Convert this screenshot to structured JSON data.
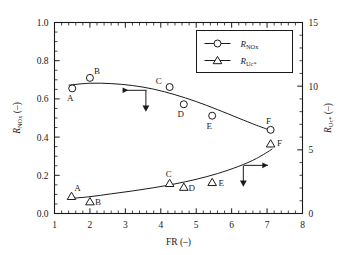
{
  "figure": {
    "background": "#ffffff",
    "frame_color": "#1b1b1b",
    "series_color": "#1b1b1b"
  },
  "axes": {
    "x": {
      "title_main": "FR",
      "title_units": "(–)",
      "min": 1,
      "max": 8,
      "ticks": [
        1,
        2,
        3,
        4,
        5,
        6,
        7,
        8
      ],
      "tick_labels": [
        "1",
        "2",
        "3",
        "4",
        "5",
        "6",
        "7",
        "8"
      ],
      "minor_per_major": 5
    },
    "y_left": {
      "title_main": "R",
      "title_sub": "NO",
      "title_sub2": "x",
      "title_units": "(–)",
      "min": 0.0,
      "max": 1.0,
      "ticks": [
        0.0,
        0.2,
        0.4,
        0.6,
        0.8,
        1.0
      ],
      "tick_labels": [
        "0.0",
        "0.2",
        "0.4",
        "0.6",
        "0.8",
        "1.0"
      ],
      "minor_per_major": 4
    },
    "y_right": {
      "title_main": "R",
      "title_sub": "Uc*",
      "title_units": "(–)",
      "min": 0,
      "max": 15,
      "ticks": [
        0,
        5,
        10,
        15
      ],
      "tick_labels": [
        "0",
        "5",
        "10",
        "15"
      ],
      "minor_per_major": 5
    }
  },
  "legend": {
    "position": "top-right",
    "entries": [
      {
        "marker": "circle",
        "label_main": "R",
        "label_sub": "NO",
        "label_sub2": "x"
      },
      {
        "marker": "triangle",
        "label_main": "R",
        "label_sub": "Uc*"
      }
    ]
  },
  "annotations": {
    "left_arrow": {
      "name": "left-pointing-arrow",
      "x": 3.6,
      "y": 0.645
    },
    "left_down_arrow": {
      "name": "down-pointing-arrow-left-series",
      "x": 3.58,
      "y_top": 0.645,
      "y_bottom": 0.545
    },
    "right_arrow": {
      "name": "right-pointing-arrow",
      "x": 6.35,
      "y": 0.252
    },
    "right_down_arrow": {
      "name": "down-pointing-arrow-right-series",
      "x": 6.33,
      "y_top": 0.252,
      "y_bottom": 0.152
    }
  },
  "chart_data": {
    "type": "scatter",
    "title": "",
    "xlabel": "FR (–)",
    "ylabel": "R_NOx (–)",
    "ylabel_right": "R_Uc* (–)",
    "xlim": [
      1,
      8
    ],
    "ylim": [
      0.0,
      1.0
    ],
    "ylim_right": [
      0,
      15
    ],
    "grid": false,
    "legend_position": "upper right",
    "series": [
      {
        "name": "R_NOx",
        "marker": "circle",
        "axis": "left",
        "point_labels": [
          "A",
          "B",
          "C",
          "D",
          "E",
          "F"
        ],
        "x": [
          1.5,
          2.0,
          4.25,
          4.65,
          5.45,
          7.1
        ],
        "values": [
          0.655,
          0.71,
          0.662,
          0.572,
          0.512,
          0.438
        ],
        "label_offsets": [
          {
            "dx": -2,
            "dy": 13
          },
          {
            "dx": 7,
            "dy": -4
          },
          {
            "dx": -11,
            "dy": -3
          },
          {
            "dx": -3,
            "dy": 13
          },
          {
            "dx": -3,
            "dy": 13
          },
          {
            "dx": -2,
            "dy": -6
          }
        ],
        "fit_curve": [
          [
            1.4,
            0.672
          ],
          [
            2.0,
            0.682
          ],
          [
            2.6,
            0.68
          ],
          [
            3.2,
            0.67
          ],
          [
            3.8,
            0.651
          ],
          [
            4.4,
            0.622
          ],
          [
            5.0,
            0.586
          ],
          [
            5.6,
            0.544
          ],
          [
            6.2,
            0.499
          ],
          [
            6.7,
            0.462
          ],
          [
            7.15,
            0.432
          ]
        ]
      },
      {
        "name": "R_Uc*",
        "marker": "triangle",
        "axis": "right",
        "point_labels": [
          "A",
          "B",
          "C",
          "D",
          "E",
          "F"
        ],
        "x": [
          1.48,
          2.0,
          4.25,
          4.65,
          5.45,
          7.1
        ],
        "values_left_scale": [
          0.09,
          0.062,
          0.158,
          0.138,
          0.163,
          0.365
        ],
        "values_right_scale": [
          1.35,
          0.93,
          2.37,
          2.07,
          2.45,
          5.48
        ],
        "label_offsets": [
          {
            "dx": 6,
            "dy": -5
          },
          {
            "dx": 8,
            "dy": 3
          },
          {
            "dx": -1,
            "dy": -6
          },
          {
            "dx": 8,
            "dy": 4
          },
          {
            "dx": 9,
            "dy": 4
          },
          {
            "dx": 9,
            "dy": 2
          }
        ],
        "fit_curve": [
          [
            1.4,
            0.078
          ],
          [
            2.0,
            0.088
          ],
          [
            2.6,
            0.103
          ],
          [
            3.2,
            0.118
          ],
          [
            3.8,
            0.135
          ],
          [
            4.4,
            0.155
          ],
          [
            5.0,
            0.179
          ],
          [
            5.6,
            0.209
          ],
          [
            6.2,
            0.247
          ],
          [
            6.7,
            0.288
          ],
          [
            7.15,
            0.338
          ]
        ]
      }
    ]
  }
}
